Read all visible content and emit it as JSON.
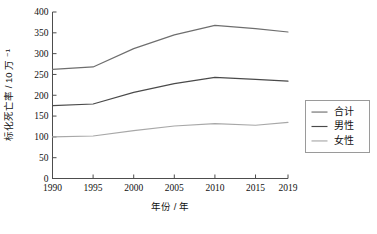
{
  "chart_data": {
    "type": "line",
    "title": "",
    "xlabel": "年份 / 年",
    "ylabel": "标化死亡率 / 10 万 ⁻¹",
    "x": [
      1990,
      1995,
      2000,
      2005,
      2010,
      2015,
      2019
    ],
    "xlim": [
      1990,
      2019
    ],
    "ylim": [
      0,
      400
    ],
    "xticks": [
      "1990",
      "1995",
      "2000",
      "2005",
      "2010",
      "2015",
      "2019"
    ],
    "yticks": [
      "0",
      "50",
      "100",
      "150",
      "200",
      "250",
      "300",
      "350",
      "400"
    ],
    "grid": false,
    "legend_position": "right",
    "series": [
      {
        "name": "合计",
        "color": "#6e6e6e",
        "values": [
          262,
          268,
          312,
          345,
          368,
          360,
          352
        ]
      },
      {
        "name": "男性",
        "color": "#4a4a4a",
        "values": [
          175,
          179,
          207,
          228,
          243,
          238,
          234
        ]
      },
      {
        "name": "女性",
        "color": "#a8a8a8",
        "values": [
          100,
          102,
          115,
          126,
          132,
          128,
          135
        ]
      }
    ]
  },
  "axes": {
    "x_axis_label": "年份 / 年",
    "y_axis_label": "标化死亡率 / 10 万 ⁻¹",
    "x_tick_labels": [
      "1990",
      "1995",
      "2000",
      "2005",
      "2010",
      "2015",
      "2019"
    ],
    "y_tick_labels": [
      "0",
      "50",
      "100",
      "150",
      "200",
      "250",
      "300",
      "350",
      "400"
    ]
  },
  "legend": {
    "items": [
      {
        "label": "合计",
        "color": "#6e6e6e"
      },
      {
        "label": "男性",
        "color": "#4a4a4a"
      },
      {
        "label": "女性",
        "color": "#a8a8a8"
      }
    ]
  },
  "colors": {
    "background": "#ffffff",
    "axis": "#4d4d4d",
    "text": "#111111",
    "legend_border": "#9a9a9a"
  }
}
